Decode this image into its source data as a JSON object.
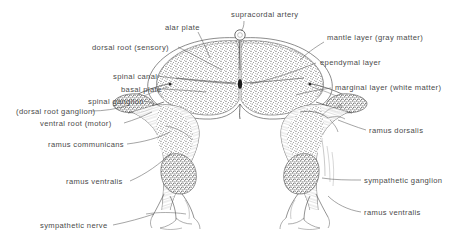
{
  "figure": {
    "background_color": "#ffffff",
    "ink_color": "#4a4a4a",
    "width": 476,
    "height": 251
  },
  "labels": [
    {
      "id": "alar-plate",
      "text": "alar plate",
      "x": 165,
      "y": 23
    },
    {
      "id": "supracordal-artery",
      "text": "supracordal artery",
      "x": 231,
      "y": 10
    },
    {
      "id": "mantle-layer",
      "text": "mantle layer (gray matter)",
      "x": 327,
      "y": 33
    },
    {
      "id": "dorsal-root",
      "text": "dorsal root (sensory)",
      "x": 92,
      "y": 43
    },
    {
      "id": "ependymal-layer",
      "text": "ependymal layer",
      "x": 320,
      "y": 58
    },
    {
      "id": "spinal-canal",
      "text": "spinal canal",
      "x": 113,
      "y": 72
    },
    {
      "id": "marginal-layer",
      "text": "marginal layer (white matter)",
      "x": 335,
      "y": 83
    },
    {
      "id": "basal-plate",
      "text": "basal plate",
      "x": 121,
      "y": 85
    },
    {
      "id": "spinal-ganglion",
      "text": "spinal ganglion",
      "x": 88,
      "y": 97
    },
    {
      "id": "dorsal-root-ganglion",
      "text": "(dorsal root ganglion)",
      "x": 16,
      "y": 107
    },
    {
      "id": "ventral-root",
      "text": "ventral root (motor)",
      "x": 40,
      "y": 119
    },
    {
      "id": "ramus-dorsalis",
      "text": "ramus dorsalis",
      "x": 369,
      "y": 126
    },
    {
      "id": "ramus-communicans",
      "text": "ramus communicans",
      "x": 48,
      "y": 140
    },
    {
      "id": "ramus-ventralis-left",
      "text": "ramus ventralis",
      "x": 66,
      "y": 177
    },
    {
      "id": "sympathetic-ganglion",
      "text": "sympathetic ganglion",
      "x": 364,
      "y": 176
    },
    {
      "id": "ramus-ventralis-right",
      "text": "ramus ventralis",
      "x": 364,
      "y": 208
    },
    {
      "id": "sympathetic-nerve",
      "text": "sympathetic nerve",
      "x": 40,
      "y": 221
    }
  ],
  "structures": [
    {
      "id": "spinal-cord",
      "name": "spinal cord cross-section"
    },
    {
      "id": "supracordal-artery-vessel",
      "name": "supracordal artery vessel"
    },
    {
      "id": "central-canal",
      "name": "central spinal canal"
    },
    {
      "id": "left-dorsal-root-ganglion",
      "name": "left spinal ganglion"
    },
    {
      "id": "right-dorsal-root-ganglion",
      "name": "right spinal ganglion"
    },
    {
      "id": "left-spinal-nerve",
      "name": "left spinal nerve trunk"
    },
    {
      "id": "right-spinal-nerve",
      "name": "right spinal nerve trunk"
    },
    {
      "id": "left-sympathetic-ganglion",
      "name": "left sympathetic ganglion"
    },
    {
      "id": "right-sympathetic-ganglion",
      "name": "right sympathetic ganglion"
    }
  ]
}
